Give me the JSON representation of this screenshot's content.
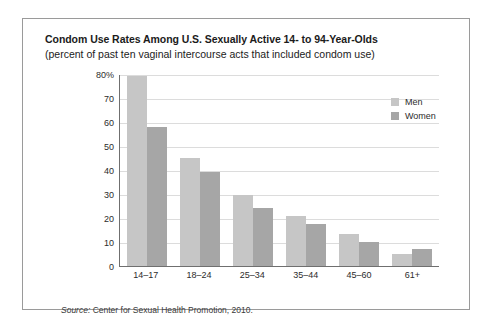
{
  "chart_data": {
    "type": "bar",
    "title": "Condom Use Rates Among U.S. Sexually Active 14- to 94-Year-Olds",
    "subtitle": "(percent of past ten vaginal intercourse acts that included condom use)",
    "xlabel": "",
    "ylabel": "",
    "ylim": [
      0,
      80
    ],
    "yticks": [
      0,
      10,
      20,
      30,
      40,
      50,
      60,
      70,
      80
    ],
    "ytick_labels": [
      "0",
      "10",
      "20",
      "30",
      "40",
      "50",
      "60",
      "70",
      "80%"
    ],
    "grid": true,
    "legend_position": "top-right",
    "categories": [
      "14–17",
      "18–24",
      "25–34",
      "35–44",
      "45–60",
      "61+"
    ],
    "series": [
      {
        "name": "Men",
        "color": "#c6c6c6",
        "values": [
          79,
          45,
          29.5,
          21,
          13.5,
          5
        ]
      },
      {
        "name": "Women",
        "color": "#a6a6a6",
        "values": [
          58,
          39,
          24,
          17.5,
          10,
          7
        ]
      }
    ],
    "source_label": "Source:",
    "source_text": " Center for Sexual Health Promotion, 2010."
  }
}
